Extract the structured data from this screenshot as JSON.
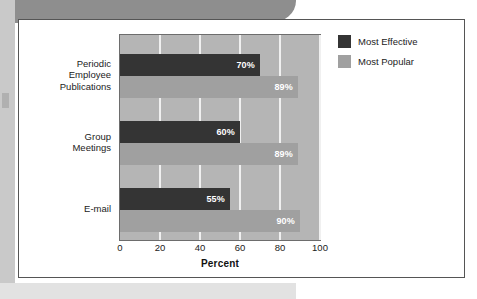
{
  "chart_data": {
    "type": "bar",
    "orientation": "horizontal",
    "title": "",
    "xlabel": "Percent",
    "ylabel": "",
    "xlim": [
      0,
      100
    ],
    "xticks": [
      0,
      20,
      40,
      60,
      80,
      100
    ],
    "grid": true,
    "legend_position": "right",
    "categories": [
      "Periodic\nEmployee\nPublications",
      "Group\nMeetings",
      "E-mail"
    ],
    "series": [
      {
        "name": "Most Effective",
        "color": "#343434",
        "values": [
          70,
          60,
          55
        ],
        "labels": [
          "70%",
          "60%",
          "55%"
        ]
      },
      {
        "name": "Most Popular",
        "color": "#a0a0a0",
        "values": [
          89,
          89,
          90
        ],
        "labels": [
          "89%",
          "89%",
          "90%"
        ]
      }
    ]
  },
  "plot": {
    "background_color": "#b5b5b5",
    "gridline_color": "#f0f0f0",
    "border_color": "#6d6d6d"
  }
}
